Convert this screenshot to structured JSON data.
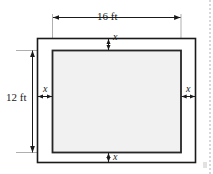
{
  "figure": {
    "type": "geometry-diagram",
    "outer": {
      "width_label": "16 ft",
      "height_label": "12 ft",
      "width_value": 16,
      "height_value": 12,
      "units": "ft",
      "fill_color": "#ffffff",
      "stroke_color": "#1a1a1a"
    },
    "inner": {
      "fill_color": "#f1f1f1",
      "stroke_color": "#262626"
    },
    "margin_labels": {
      "top": "x",
      "bottom": "x",
      "left": "x",
      "right": "x"
    },
    "dimensions": [
      {
        "name": "top-width-dimension",
        "label": "16 ft",
        "orientation": "horizontal"
      },
      {
        "name": "left-height-dimension",
        "label": "12 ft",
        "orientation": "vertical"
      },
      {
        "name": "top-margin-dimension",
        "label": "x",
        "orientation": "vertical"
      },
      {
        "name": "bottom-margin-dimension",
        "label": "x",
        "orientation": "vertical"
      },
      {
        "name": "left-margin-dimension",
        "label": "x",
        "orientation": "horizontal"
      },
      {
        "name": "right-margin-dimension",
        "label": "x",
        "orientation": "horizontal"
      }
    ]
  }
}
